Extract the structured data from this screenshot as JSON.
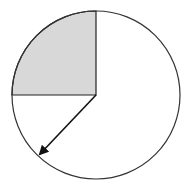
{
  "diagram": {
    "type": "circle-sector-with-radius-arrow",
    "circle": {
      "cx": 96,
      "cy": 95,
      "r": 84
    },
    "shaded_sector": {
      "start_angle_deg": 90,
      "end_angle_deg": 180,
      "fill": "#d8d8d8",
      "description": "quarter circle, upper-left"
    },
    "arrow": {
      "from": [
        96,
        95
      ],
      "to": [
        37,
        157
      ],
      "description": "radius arrow pointing to lower-left on circumference"
    },
    "colors": {
      "stroke": "#222222",
      "fill": "#d8d8d8",
      "background": "#ffffff"
    }
  }
}
